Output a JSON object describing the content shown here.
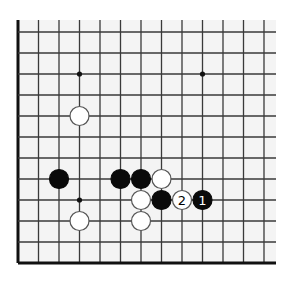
{
  "diagram": {
    "type": "go-board-corner",
    "colors": {
      "page_background": "#ffffff",
      "board_background": "#f4f4f4",
      "grid_line": "#3a3a3a",
      "edge_line": "#111111",
      "black_stone": "#0a0a0a",
      "white_stone": "#ffffff",
      "white_stone_border": "#555555",
      "star_point": "#111111"
    },
    "grid": {
      "columns": 13,
      "rows": 12,
      "origin_x": 18,
      "origin_y": 32,
      "spacing_x": 20.5,
      "spacing_y": 21,
      "open_top_extension": 12,
      "open_right_extension": 12,
      "thick_edges": [
        "left",
        "bottom"
      ]
    },
    "star_points": [
      {
        "col": 3,
        "row": 2
      },
      {
        "col": 9,
        "row": 2
      },
      {
        "col": 3,
        "row": 8
      }
    ],
    "stones": [
      {
        "col": 3,
        "row": 4,
        "color": "white",
        "label": ""
      },
      {
        "col": 2,
        "row": 7,
        "color": "black",
        "label": ""
      },
      {
        "col": 5,
        "row": 7,
        "color": "black",
        "label": ""
      },
      {
        "col": 6,
        "row": 7,
        "color": "black",
        "label": ""
      },
      {
        "col": 7,
        "row": 7,
        "color": "white",
        "label": ""
      },
      {
        "col": 6,
        "row": 8,
        "color": "white",
        "label": ""
      },
      {
        "col": 7,
        "row": 8,
        "color": "black",
        "label": ""
      },
      {
        "col": 8,
        "row": 8,
        "color": "white",
        "label": "2"
      },
      {
        "col": 9,
        "row": 8,
        "color": "black",
        "label": "1"
      },
      {
        "col": 3,
        "row": 9,
        "color": "white",
        "label": ""
      },
      {
        "col": 6,
        "row": 9,
        "color": "white",
        "label": ""
      }
    ],
    "stone_radius": 9.5
  }
}
